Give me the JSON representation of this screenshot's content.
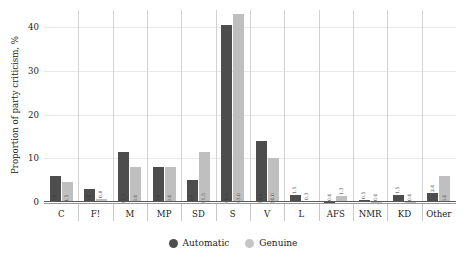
{
  "chart_data": {
    "type": "bar",
    "title": "",
    "xlabel": "",
    "ylabel": "Proportion of party criticism, %",
    "ylim": [
      0,
      44
    ],
    "yticks": [
      0,
      10,
      20,
      30,
      40
    ],
    "grid": true,
    "legend_position": "bottom",
    "categories": [
      "C",
      "F!",
      "M",
      "MP",
      "SD",
      "S",
      "V",
      "L",
      "AFS",
      "NMR",
      "KD",
      "Other"
    ],
    "series": [
      {
        "name": "Automatic",
        "color": "#4d4d4d",
        "values": [
          6.0,
          3.0,
          11.5,
          8.0,
          5.0,
          40.5,
          14.0,
          1.5,
          0.0,
          0.5,
          1.5,
          2.0
        ],
        "labels": [
          "6.0",
          "3.0",
          "11.5",
          "8.0",
          "5.0",
          "40.5",
          "14.0",
          "1.5",
          "0.0",
          "0.5",
          "1.5",
          "2.0"
        ]
      },
      {
        "name": "Genuine",
        "color": "#bfbfbf",
        "values": [
          4.5,
          0.8,
          8.0,
          8.0,
          11.5,
          43.0,
          10.0,
          0.3,
          1.3,
          0.0,
          0.0,
          6.0
        ],
        "labels": [
          "4.5",
          "0.8",
          "8.0",
          "8.0",
          "11.5",
          "43.0",
          "10.0",
          "0.3",
          "1.3",
          "0.0",
          "0.0",
          "6.0"
        ]
      }
    ]
  },
  "legend": {
    "items": [
      {
        "label": "Automatic",
        "marker": "circle-marker-automatic"
      },
      {
        "label": "Genuine",
        "marker": "circle-marker-genuine"
      }
    ]
  }
}
